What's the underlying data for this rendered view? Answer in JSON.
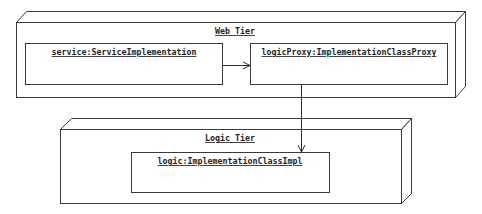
{
  "diagram": {
    "type": "uml-deployment",
    "nodes": [
      {
        "id": "web-tier",
        "label": "Web Tier",
        "instances": [
          {
            "id": "service",
            "label": "service:ServiceImplementation"
          },
          {
            "id": "logicProxy",
            "label": "logicProxy:ImplementationClassProxy"
          }
        ]
      },
      {
        "id": "logic-tier",
        "label": "Logic Tier",
        "instances": [
          {
            "id": "logic",
            "label": "logic:ImplementationClassImpl"
          }
        ]
      }
    ],
    "edges": [
      {
        "from": "service",
        "to": "logicProxy",
        "style": "open-arrow"
      },
      {
        "from": "logicProxy",
        "to": "logic",
        "style": "open-arrow"
      }
    ],
    "colors": {
      "line": "#3a3a3a",
      "text": "#1e1e1e",
      "background": "#ffffff"
    }
  }
}
